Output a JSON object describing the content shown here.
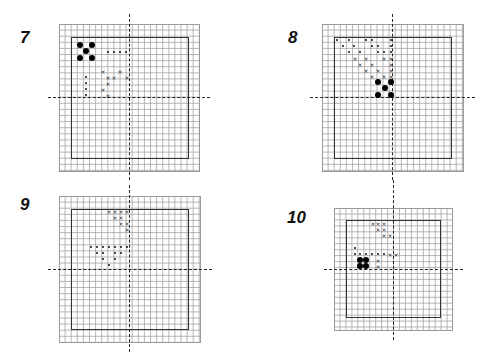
{
  "figures": [
    {
      "label": "7",
      "label_pos": [
        20,
        28
      ],
      "grid": {
        "x": 59,
        "y": 24,
        "w": 141,
        "h": 148,
        "cell": 6.1
      },
      "inner": {
        "x": 71,
        "y": 37,
        "w": 118,
        "h": 122
      },
      "axis_v": {
        "x": 129,
        "y1": 14,
        "y2": 180
      },
      "axis_h": {
        "y": 97,
        "x1": 48,
        "x2": 210
      },
      "big_dots": [
        [
          80,
          45
        ],
        [
          92,
          45
        ],
        [
          86,
          51
        ],
        [
          80,
          58
        ],
        [
          92,
          58
        ]
      ],
      "small_dots": [
        [
          108,
          52
        ],
        [
          114,
          52
        ],
        [
          120,
          52
        ],
        [
          126,
          52
        ],
        [
          86,
          77
        ],
        [
          86,
          83
        ],
        [
          86,
          89
        ],
        [
          86,
          95
        ]
      ],
      "x_marks": [
        [
          103,
          71
        ],
        [
          120,
          71
        ],
        [
          108,
          77
        ],
        [
          114,
          77
        ],
        [
          127,
          77
        ],
        [
          108,
          83
        ],
        [
          103,
          89
        ],
        [
          108,
          95
        ]
      ]
    },
    {
      "label": "8",
      "label_pos": [
        288,
        28
      ],
      "grid": {
        "x": 322,
        "y": 24,
        "w": 142,
        "h": 148,
        "cell": 6.1
      },
      "inner": {
        "x": 334,
        "y": 37,
        "w": 118,
        "h": 122
      },
      "axis_v": {
        "x": 392,
        "y1": 14,
        "y2": 180
      },
      "axis_h": {
        "y": 97,
        "x1": 310,
        "x2": 475
      },
      "big_dots": [
        [
          378,
          82
        ],
        [
          391,
          82
        ],
        [
          385,
          88
        ],
        [
          378,
          95
        ],
        [
          391,
          95
        ]
      ],
      "small_dots": [
        [
          337,
          40
        ],
        [
          349,
          40
        ],
        [
          366,
          40
        ],
        [
          372,
          40
        ],
        [
          391,
          40
        ],
        [
          343,
          46
        ],
        [
          354,
          46
        ],
        [
          372,
          46
        ],
        [
          378,
          46
        ],
        [
          391,
          46
        ],
        [
          349,
          52
        ],
        [
          360,
          52
        ],
        [
          378,
          52
        ],
        [
          384,
          52
        ],
        [
          391,
          52
        ]
      ],
      "x_marks": [
        [
          355,
          58
        ],
        [
          366,
          58
        ],
        [
          384,
          58
        ],
        [
          391,
          58
        ],
        [
          360,
          64
        ],
        [
          372,
          64
        ],
        [
          391,
          64
        ],
        [
          366,
          70
        ],
        [
          378,
          70
        ],
        [
          391,
          70
        ],
        [
          372,
          76
        ],
        [
          384,
          76
        ],
        [
          391,
          76
        ]
      ]
    },
    {
      "label": "9",
      "label_pos": [
        20,
        195
      ],
      "grid": {
        "x": 59,
        "y": 196,
        "w": 142,
        "h": 147,
        "cell": 6.1
      },
      "inner": {
        "x": 71,
        "y": 209,
        "w": 118,
        "h": 121
      },
      "axis_v": {
        "x": 129,
        "y1": 185,
        "y2": 352
      },
      "axis_h": {
        "y": 269,
        "x1": 48,
        "x2": 212
      },
      "big_dots": [],
      "small_dots": [
        [
          91,
          247
        ],
        [
          97,
          247
        ],
        [
          103,
          247
        ],
        [
          109,
          247
        ],
        [
          115,
          247
        ],
        [
          121,
          247
        ],
        [
          127,
          247
        ],
        [
          97,
          253
        ],
        [
          103,
          253
        ],
        [
          115,
          253
        ],
        [
          121,
          253
        ],
        [
          103,
          259
        ],
        [
          115,
          259
        ],
        [
          109,
          265
        ]
      ],
      "x_marks": [
        [
          109,
          211
        ],
        [
          115,
          211
        ],
        [
          121,
          211
        ],
        [
          127,
          211
        ],
        [
          115,
          217
        ],
        [
          121,
          217
        ],
        [
          121,
          223
        ],
        [
          127,
          223
        ],
        [
          127,
          229
        ]
      ]
    },
    {
      "label": "10",
      "label_pos": [
        287,
        208
      ],
      "grid": {
        "x": 334,
        "y": 208,
        "w": 119,
        "h": 123,
        "cell": 5.95
      },
      "inner": {
        "x": 346,
        "y": 220,
        "w": 95,
        "h": 98
      },
      "axis_v": {
        "x": 393,
        "y1": 180,
        "y2": 340
      },
      "axis_h": {
        "y": 269,
        "x1": 324,
        "x2": 463
      },
      "big_dots": [
        [
          360,
          260
        ],
        [
          366,
          260
        ],
        [
          360,
          266
        ],
        [
          366,
          266
        ]
      ],
      "small_dots": [
        [
          355,
          248
        ],
        [
          355,
          254
        ],
        [
          360,
          254
        ],
        [
          366,
          254
        ],
        [
          372,
          254
        ],
        [
          378,
          254
        ],
        [
          384,
          254
        ]
      ],
      "x_marks": [
        [
          373,
          223
        ],
        [
          378,
          223
        ],
        [
          384,
          223
        ],
        [
          378,
          229
        ],
        [
          384,
          229
        ],
        [
          384,
          235
        ],
        [
          390,
          235
        ],
        [
          390,
          254
        ],
        [
          396,
          254
        ],
        [
          378,
          260
        ],
        [
          378,
          266
        ]
      ]
    }
  ],
  "colors": {
    "grid_line": "#9a9a9a",
    "inner_border": "#333333",
    "marker": "#000000"
  }
}
